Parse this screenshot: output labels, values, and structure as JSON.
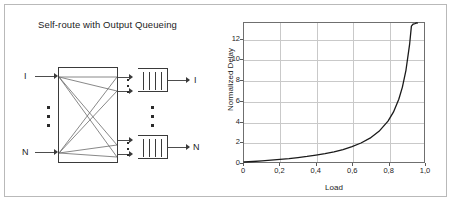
{
  "figure": {
    "background_color": "#ffffff",
    "border_color": "#b9b9b9"
  },
  "diagram": {
    "title": "Self-route with Output Queueing",
    "input_labels": [
      "I",
      "N"
    ],
    "output_labels": [
      "I",
      "N"
    ],
    "input_ellipsis": "vertical-dots",
    "output_ellipsis": "vertical-dots",
    "switch_fabric": {
      "name": "self-routing-switch-fabric",
      "crossbar": true
    },
    "queues": [
      {
        "name": "output-queue-top",
        "cells": 4
      },
      {
        "name": "output-queue-bottom",
        "cells": 4
      }
    ]
  },
  "chart_data": {
    "type": "line",
    "title": "",
    "xlabel": "Load",
    "ylabel": "Normalized Delay",
    "xlim": [
      0,
      1.0
    ],
    "ylim": [
      0,
      13.6
    ],
    "grid": true,
    "legend": "none",
    "line_color": "#1a1a1a",
    "xticks": [
      0,
      0.2,
      0.4,
      0.6,
      0.8,
      1.0
    ],
    "xtick_labels": [
      "0",
      "0,2",
      "0,4",
      "0,6",
      "0,8",
      "1,0"
    ],
    "yticks": [
      0,
      2,
      4,
      6,
      8,
      10,
      12
    ],
    "ytick_labels": [
      "0",
      "2",
      "4",
      "6",
      "8",
      "10",
      "12"
    ],
    "series": [
      {
        "name": "Normalized Delay vs Load",
        "x": [
          0.0,
          0.05,
          0.1,
          0.15,
          0.2,
          0.25,
          0.3,
          0.35,
          0.4,
          0.45,
          0.5,
          0.55,
          0.6,
          0.65,
          0.7,
          0.75,
          0.8,
          0.83,
          0.86,
          0.88,
          0.9,
          0.92,
          0.93,
          0.94,
          0.95,
          0.955,
          0.96,
          0.963
        ],
        "y": [
          0.0,
          0.05,
          0.11,
          0.18,
          0.25,
          0.33,
          0.43,
          0.54,
          0.67,
          0.82,
          1.0,
          1.22,
          1.5,
          1.86,
          2.33,
          3.0,
          4.0,
          4.88,
          6.14,
          7.33,
          9.0,
          11.5,
          13.29,
          13.5,
          13.55,
          13.58,
          13.6,
          13.6
        ]
      }
    ]
  }
}
